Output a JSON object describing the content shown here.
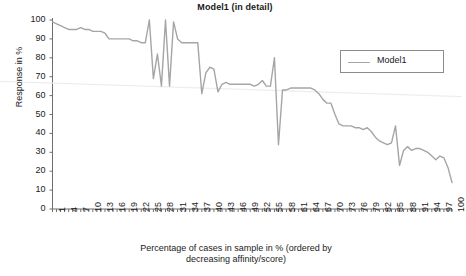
{
  "chart_data": {
    "type": "line",
    "title": "Model1 (in detail)",
    "xlabel": "Percentage of cases in sample in % (ordered by decreasing affinity/score)",
    "xlabel_line1": "Percentage of cases in sample in % (ordered by",
    "xlabel_line2": "decreasing affinity/score)",
    "ylabel": "Response in %",
    "ylim": [
      0,
      100
    ],
    "xlim": [
      1,
      100
    ],
    "ytick_labels": [
      "100",
      "90",
      "80",
      "70",
      "60",
      "50",
      "40",
      "30",
      "20",
      "10",
      "0"
    ],
    "ytick_values": [
      100,
      90,
      80,
      70,
      60,
      50,
      40,
      30,
      20,
      10,
      0
    ],
    "xtick_labels": [
      "1",
      "4",
      "7",
      "10",
      "13",
      "16",
      "19",
      "22",
      "25",
      "28",
      "31",
      "34",
      "37",
      "40",
      "43",
      "46",
      "49",
      "52",
      "55",
      "58",
      "61",
      "64",
      "67",
      "70",
      "73",
      "76",
      "79",
      "82",
      "85",
      "88",
      "91",
      "94",
      "97",
      "100"
    ],
    "xtick_values": [
      1,
      4,
      7,
      10,
      13,
      16,
      19,
      22,
      25,
      28,
      31,
      34,
      37,
      40,
      43,
      46,
      49,
      52,
      55,
      58,
      61,
      64,
      67,
      70,
      73,
      76,
      79,
      82,
      85,
      88,
      91,
      94,
      97,
      100
    ],
    "grid": false,
    "legend_position": "upper-right",
    "series": [
      {
        "name": "Model1",
        "color": "#a5a5a5",
        "x": [
          1,
          2,
          3,
          4,
          5,
          6,
          7,
          8,
          9,
          10,
          11,
          12,
          13,
          14,
          15,
          16,
          17,
          18,
          19,
          20,
          21,
          22,
          23,
          24,
          25,
          26,
          27,
          28,
          29,
          30,
          31,
          32,
          33,
          34,
          35,
          36,
          37,
          38,
          39,
          40,
          41,
          42,
          43,
          44,
          45,
          46,
          47,
          48,
          49,
          50,
          51,
          52,
          53,
          54,
          55,
          56,
          57,
          58,
          59,
          60,
          61,
          62,
          63,
          64,
          65,
          66,
          67,
          68,
          69,
          70,
          71,
          72,
          73,
          74,
          75,
          76,
          77,
          78,
          79,
          80,
          81,
          82,
          83,
          84,
          85,
          86,
          87,
          88,
          89,
          90,
          91,
          92,
          93,
          94,
          95,
          96,
          97,
          98,
          99,
          100
        ],
        "values": [
          99,
          98,
          97,
          96,
          95,
          95,
          95,
          96,
          95,
          95,
          94,
          94,
          94,
          93,
          90,
          90,
          90,
          90,
          90,
          90,
          89,
          89,
          88,
          88,
          100,
          69,
          82,
          65,
          100,
          65,
          99,
          90,
          88,
          88,
          88,
          88,
          88,
          61,
          72,
          75,
          74,
          62,
          66,
          67,
          66,
          66,
          66,
          66,
          66,
          66,
          65,
          66,
          68,
          65,
          65,
          80,
          34,
          63,
          63,
          64,
          64,
          64,
          64,
          64,
          64,
          63,
          61,
          58,
          56,
          56,
          50,
          45,
          44,
          44,
          44,
          43,
          43,
          42,
          43,
          41,
          38,
          36,
          35,
          34,
          35,
          44,
          23,
          31,
          33,
          31,
          32,
          32,
          31,
          30,
          28,
          26,
          28,
          27,
          22,
          14
        ]
      },
      {
        "name": "trendline",
        "color": "#ededed",
        "x": [
          1,
          100
        ],
        "values": [
          67.5,
          59.5
        ]
      }
    ]
  },
  "legend": {
    "entries": [
      {
        "label": "Model1",
        "color": "#a5a5a5"
      }
    ]
  }
}
